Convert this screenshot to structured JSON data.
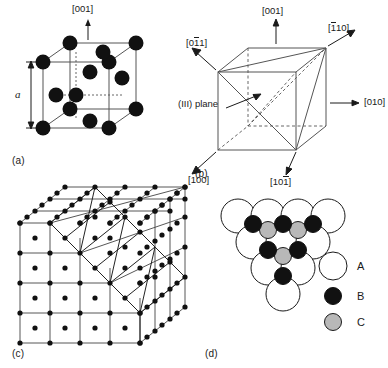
{
  "figure": {
    "background_color": "#ffffff",
    "ink_color": "#1a1a1a",
    "atom_fill_black": "#111111",
    "atom_fill_gray": "#b8b8b8",
    "atom_fill_white": "#ffffff"
  },
  "panels": {
    "a": {
      "label": "(a)",
      "caption_direction": "[001]",
      "lattice_parameter": "a",
      "description": "Face-centred cubic unit cell with corner and face-centre atoms"
    },
    "b": {
      "label": "(b)",
      "plane_label": "(III) plane",
      "directions": {
        "up": "[001]",
        "upper_left": {
          "pre": "[0",
          "bar": "1",
          "post": "1]"
        },
        "upper_right": {
          "pre": "[",
          "bar": "1",
          "post": "10]"
        },
        "right": "[010]",
        "lower_left": "[100]",
        "lower_right": {
          "pre": "[10",
          "bar": "1",
          "post": "]"
        }
      }
    },
    "c": {
      "label": "(c)",
      "description": "Array of FCC unit cells showing a stepped (111) surface"
    },
    "d": {
      "label": "(d)",
      "description": "Close packed plane stacking showing A, B and C sites",
      "legend": [
        {
          "key": "A",
          "label": "A",
          "style": "large-white"
        },
        {
          "key": "B",
          "label": "B",
          "style": "small-black"
        },
        {
          "key": "C",
          "label": "C",
          "style": "small-gray"
        }
      ]
    }
  }
}
